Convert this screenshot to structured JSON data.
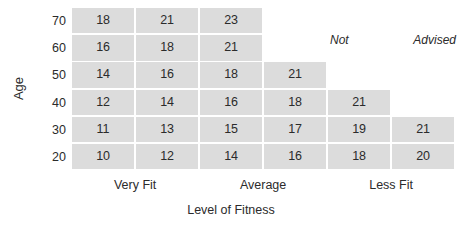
{
  "chart_data": {
    "type": "heatmap",
    "title": "",
    "xlabel": "Level of Fitness",
    "ylabel": "Age",
    "grid": false,
    "legend": "none",
    "x_categories": [
      "Very Fit",
      "Average",
      "Less Fit"
    ],
    "columns": [
      "1",
      "2",
      "3",
      "4",
      "5",
      "6"
    ],
    "y_ticks": [
      "70",
      "60",
      "50",
      "40",
      "30",
      "20"
    ],
    "annotation": {
      "word1": "Not",
      "word2": "Advised",
      "full_text": "Not Advised",
      "style": "italic"
    },
    "cell_color": "#dcdcdc",
    "text_color": "#2b2b2b",
    "background": "#ffffff",
    "rows": [
      {
        "age": "70",
        "values": [
          "18",
          "21",
          "23",
          "",
          "",
          ""
        ]
      },
      {
        "age": "60",
        "values": [
          "16",
          "18",
          "21",
          "",
          "",
          ""
        ]
      },
      {
        "age": "50",
        "values": [
          "14",
          "16",
          "18",
          "21",
          "",
          ""
        ]
      },
      {
        "age": "40",
        "values": [
          "12",
          "14",
          "16",
          "18",
          "21",
          ""
        ]
      },
      {
        "age": "30",
        "values": [
          "11",
          "13",
          "15",
          "17",
          "19",
          "21"
        ]
      },
      {
        "age": "20",
        "values": [
          "10",
          "12",
          "14",
          "16",
          "18",
          "20"
        ]
      }
    ]
  }
}
